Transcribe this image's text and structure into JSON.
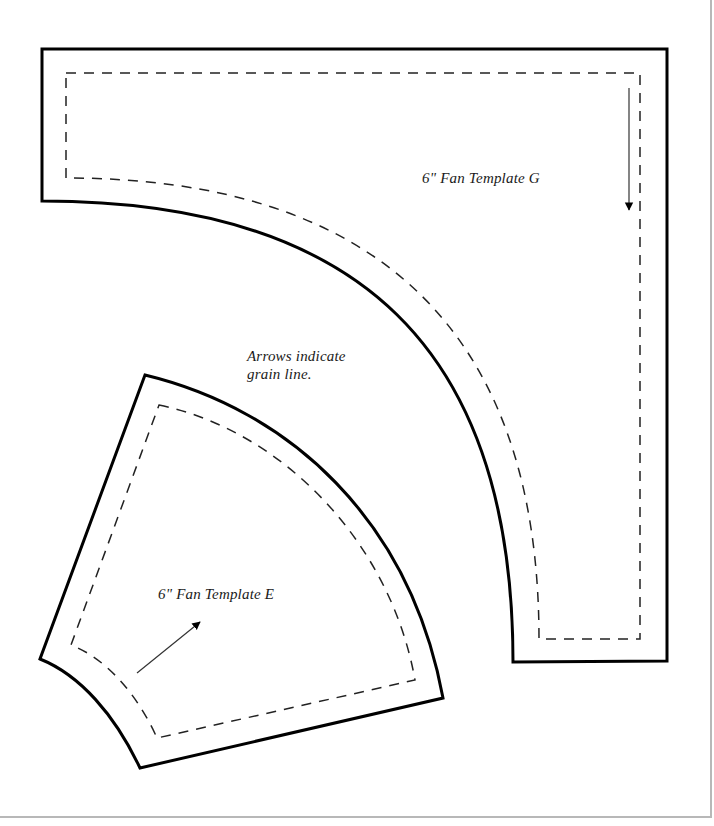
{
  "templates": {
    "g": {
      "label": "6\" Fan Template G",
      "grain_arrow": "down"
    },
    "e": {
      "label": "6\" Fan Template E",
      "grain_arrow": "up-right"
    }
  },
  "note": {
    "line1": "Arrows indicate",
    "line2": "grain line."
  },
  "colors": {
    "outline": "#000000",
    "seam": "#222222",
    "page_border": "#b8b8b8",
    "background": "#ffffff"
  }
}
